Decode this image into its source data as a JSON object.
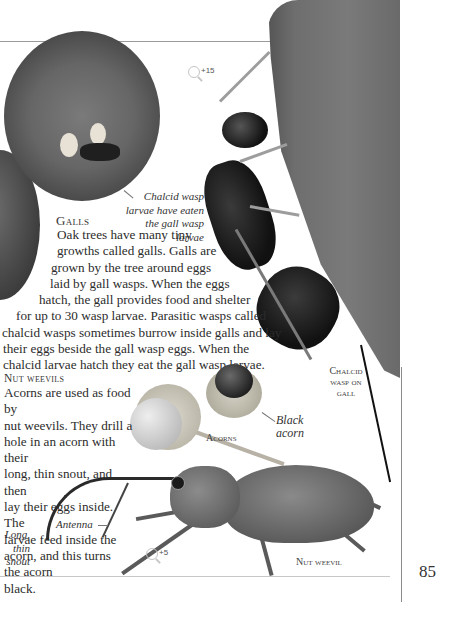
{
  "page": {
    "number": "85"
  },
  "galls": {
    "heading": "Galls",
    "lines": [
      "Oak trees have many tiny",
      "growths called galls. Galls are",
      "grown by the tree around eggs",
      "laid by gall wasps. When the eggs",
      "hatch, the gall provides food and shelter",
      "for up to 30 wasp larvae. Parasitic wasps called",
      "chalcid wasps sometimes burrow inside galls and lay",
      "their eggs beside the gall wasp eggs. When the",
      "chalcid larvae hatch they eat the gall wasp larvae."
    ],
    "caption_lines": [
      "Chalcid wasp",
      "larvae have eaten",
      "the gall wasp larvae"
    ],
    "magnification": "+15"
  },
  "chalcid_label": {
    "lines": [
      "Chalcid",
      "wasp on",
      "gall"
    ]
  },
  "nut_weevils": {
    "heading": "Nut weevils",
    "lines": [
      "Acorns are used as food by",
      "nut weevils. They drill a",
      "hole in an acorn with their",
      "long, thin snout, and then",
      "lay their eggs inside. The",
      "larvae feed inside the",
      "acorn, and this turns",
      "the acorn",
      "black."
    ]
  },
  "acorns": {
    "label": "Acorns",
    "black_acorn_lines": [
      "Black",
      "acorn"
    ]
  },
  "weevil": {
    "antenna_label": "Antenna",
    "snout_lines": [
      "Long,",
      "thin",
      "snout"
    ],
    "label": "Nut weevil",
    "magnification": "+5"
  }
}
